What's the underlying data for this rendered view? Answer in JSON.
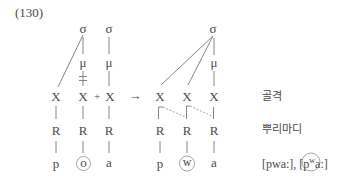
{
  "example_number": "(130)",
  "left_structure": {
    "syllables": [
      "σ",
      "σ"
    ],
    "moras": [
      "μ",
      "μ"
    ],
    "delink_mark": "ǂ",
    "skeleton": [
      "X",
      "X",
      "X"
    ],
    "plus": "+",
    "roots": [
      "R",
      "R",
      "R"
    ],
    "segments": [
      "p",
      "o",
      "a"
    ],
    "circled_segment": "o"
  },
  "arrow": "→",
  "right_structure": {
    "syllable": "σ",
    "mora": "μ",
    "skeleton": [
      "X",
      "X",
      "X"
    ],
    "roots": [
      "R",
      "R",
      "R"
    ],
    "segments": [
      "p",
      "w",
      "a"
    ],
    "circled_segment": "w"
  },
  "tier_labels": {
    "skeleton": "골격",
    "root": "뿌리마디",
    "output": {
      "form1": "[pwa:],",
      "form2_pre": "[p",
      "form2_sup": "w",
      "form2_post": "a:]"
    }
  },
  "colors": {
    "text": "#4a4a4a",
    "lines": "#777777",
    "circle": "#9a9a9a"
  }
}
